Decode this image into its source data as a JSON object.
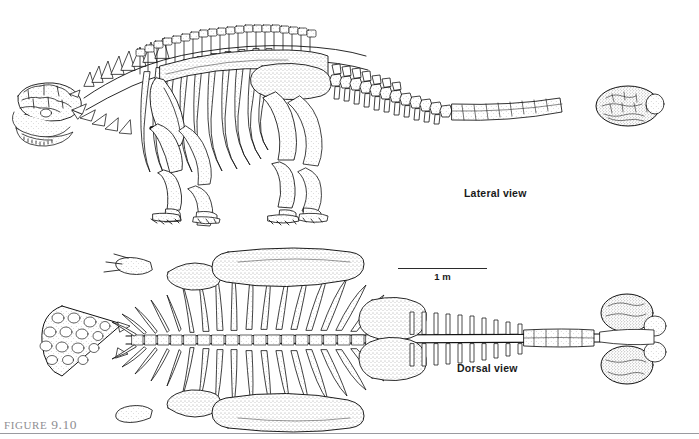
{
  "figure": {
    "caption_prefix": "Figure",
    "caption_number": "9.10",
    "background_color": "#ffffff",
    "ink_color": "#111111",
    "caption_color": "#8e8e92",
    "rule_color": "#9a9a9f"
  },
  "panels": {
    "lateral": {
      "label": "Lateral view",
      "subject": "ankylosaur-skeleton-lateral"
    },
    "dorsal": {
      "label": "Dorsal view",
      "subject": "ankylosaur-skeleton-dorsal"
    }
  },
  "scale": {
    "label": "1 m",
    "length_px": 89
  }
}
